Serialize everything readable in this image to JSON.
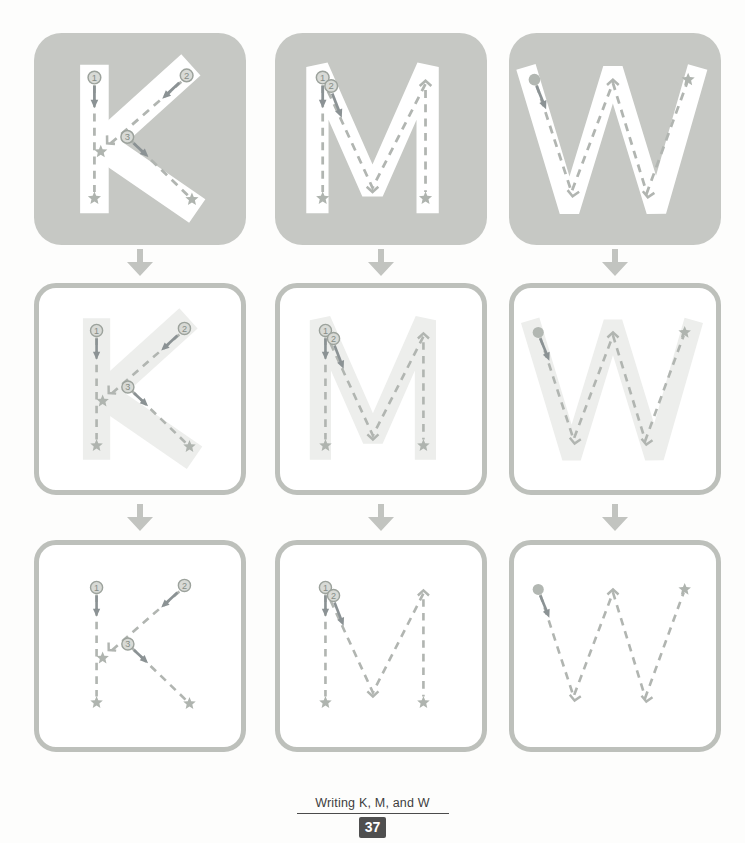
{
  "footer": {
    "title": "Writing K, M, and W",
    "page_number": "37"
  },
  "colors": {
    "page_bg": "#fdfdfc",
    "tile_bg": "#c6c8c4",
    "box_border": "#bdc0bb",
    "letter_white": "#ffffff",
    "letter_faint": "#edeeec",
    "guide": "#b1b5b1",
    "stroke_arrow": "#8b9294",
    "marker_fill": "#d8dad6",
    "marker_stroke": "#9ca29c",
    "marker_text": "#868d87",
    "star": "#afb4af",
    "dot": "#b2b7b2",
    "flow_arrow": "#c2c4c0",
    "footer_text": "#3e3e3e",
    "rule_color": "#4b4b4b",
    "badge_bg": "#4f4f4f",
    "badge_text": "#ffffff"
  },
  "rows": [
    {
      "id": "model",
      "tile": "solid",
      "letter": "white"
    },
    {
      "id": "guided",
      "tile": "outlined",
      "letter": "faint"
    },
    {
      "id": "practice",
      "tile": "outlined",
      "letter": "none"
    }
  ],
  "letters": [
    {
      "name": "K",
      "shape": [
        {
          "pts": [
            [
              57,
              30
            ],
            [
              57,
              170
            ]
          ],
          "w": 27
        },
        {
          "pts": [
            [
              148,
              30
            ],
            [
              64,
              106
            ],
            [
              154,
              168
            ]
          ],
          "w": 27
        }
      ],
      "guides": [
        {
          "t": "dash",
          "pts": [
            [
              57,
              49
            ],
            [
              57,
              150
            ]
          ]
        },
        {
          "t": "num",
          "x": 57,
          "y": 42,
          "label": "1"
        },
        {
          "t": "arrow",
          "x1": 57,
          "y1": 50,
          "x2": 57,
          "y2": 71
        },
        {
          "t": "star",
          "x": 57,
          "y": 156
        },
        {
          "t": "dash",
          "pts": [
            [
              139,
              46
            ],
            [
              69,
              107
            ]
          ]
        },
        {
          "t": "num",
          "x": 144,
          "y": 40,
          "label": "2"
        },
        {
          "t": "arrow",
          "x1": 137,
          "y1": 47,
          "x2": 121,
          "y2": 62
        },
        {
          "t": "chev",
          "x": 69,
          "y": 104,
          "angle": 47
        },
        {
          "t": "star",
          "x": 63,
          "y": 112
        },
        {
          "t": "dash",
          "pts": [
            [
              91,
              101
            ],
            [
              146,
              154
            ]
          ]
        },
        {
          "t": "num",
          "x": 88,
          "y": 98,
          "label": "3"
        },
        {
          "t": "arrow",
          "x1": 94,
          "y1": 104,
          "x2": 108,
          "y2": 117
        },
        {
          "t": "star",
          "x": 149,
          "y": 157
        }
      ]
    },
    {
      "name": "M",
      "shape": [
        {
          "pts": [
            [
              40,
              170
            ],
            [
              40,
              32
            ],
            [
              92,
              150
            ],
            [
              144,
              32
            ],
            [
              144,
              170
            ]
          ],
          "w": 21
        }
      ],
      "guides": [
        {
          "t": "dash",
          "pts": [
            [
              45,
              49
            ],
            [
              45,
              150
            ]
          ]
        },
        {
          "t": "num",
          "x": 45,
          "y": 42,
          "label": "1"
        },
        {
          "t": "arrow",
          "x1": 45,
          "y1": 50,
          "x2": 45,
          "y2": 71
        },
        {
          "t": "star",
          "x": 45,
          "y": 156
        },
        {
          "t": "dash",
          "pts": [
            [
              50,
              55
            ],
            [
              92,
              146
            ],
            [
              142,
              48
            ],
            [
              142,
              150
            ]
          ]
        },
        {
          "t": "num",
          "x": 53,
          "y": 50,
          "label": "2"
        },
        {
          "t": "arrow",
          "x1": 54,
          "y1": 57,
          "x2": 63,
          "y2": 80
        },
        {
          "t": "chev",
          "x": 92,
          "y": 150,
          "angle": 0
        },
        {
          "t": "chev",
          "x": 142,
          "y": 45,
          "angle": 180
        },
        {
          "t": "star",
          "x": 142,
          "y": 156
        }
      ]
    },
    {
      "name": "W",
      "shape": [
        {
          "pts": [
            [
              16,
              32
            ],
            [
              57,
              168
            ],
            [
              98,
              34
            ],
            [
              139,
              168
            ],
            [
              178,
              32
            ]
          ],
          "w": 19
        }
      ],
      "guides": [
        {
          "t": "dash",
          "pts": [
            [
              26,
              49
            ],
            [
              59,
              150
            ],
            [
              98,
              47
            ],
            [
              130,
              151
            ],
            [
              168,
              47
            ]
          ]
        },
        {
          "t": "dot",
          "x": 24,
          "y": 44
        },
        {
          "t": "arrow",
          "x1": 26,
          "y1": 50,
          "x2": 35,
          "y2": 72
        },
        {
          "t": "chev",
          "x": 60,
          "y": 154,
          "angle": 8
        },
        {
          "t": "chev",
          "x": 98,
          "y": 44,
          "angle": 180
        },
        {
          "t": "chev",
          "x": 131,
          "y": 155,
          "angle": 8
        },
        {
          "t": "star",
          "x": 169,
          "y": 44
        }
      ]
    }
  ]
}
